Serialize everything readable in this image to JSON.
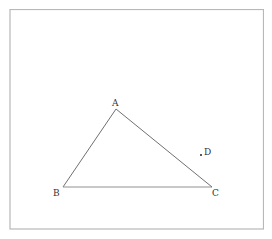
{
  "diagram": {
    "type": "geometry-triangle",
    "points": [
      {
        "label": "A",
        "x": 116,
        "y": 109
      },
      {
        "label": "B",
        "x": 63,
        "y": 187
      },
      {
        "label": "C",
        "x": 212,
        "y": 187
      },
      {
        "label": "D",
        "x": 201,
        "y": 155
      }
    ],
    "segments": [
      [
        "A",
        "B"
      ],
      [
        "B",
        "C"
      ],
      [
        "C",
        "A"
      ]
    ],
    "colors": {
      "border": "#b8b8b8",
      "line": "#707070",
      "text": "#333333",
      "point": "#222222"
    }
  }
}
